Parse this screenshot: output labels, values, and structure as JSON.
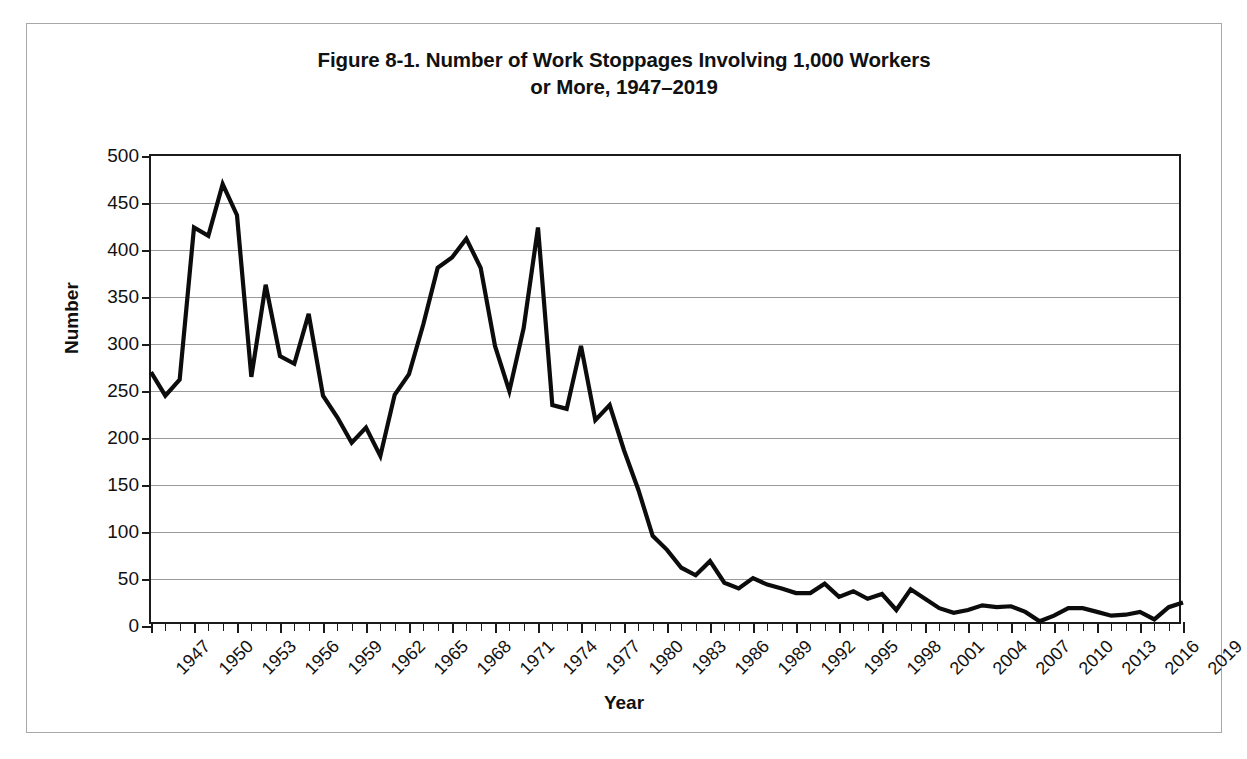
{
  "page": {
    "artifact_text": ""
  },
  "figure": {
    "title_line1": "Figure 8-1. Number of Work Stoppages Involving 1,000 Workers",
    "title_line2": "or More, 1947–2019"
  },
  "chart_data": {
    "type": "line",
    "title": "Figure 8-1. Number of Work Stoppages Involving 1,000 Workers or More, 1947–2019",
    "xlabel": "Year",
    "ylabel": "Number",
    "ylim": [
      0,
      500
    ],
    "ytick_step": 50,
    "yticks": [
      "0",
      "50",
      "100",
      "150",
      "200",
      "250",
      "300",
      "350",
      "400",
      "450",
      "500"
    ],
    "xlim": [
      1947,
      2019
    ],
    "xtick_step": 3,
    "xticks": [
      "1947",
      "1950",
      "1953",
      "1956",
      "1959",
      "1962",
      "1965",
      "1968",
      "1971",
      "1974",
      "1977",
      "1980",
      "1983",
      "1986",
      "1989",
      "1992",
      "1995",
      "1998",
      "2001",
      "2004",
      "2007",
      "2010",
      "2013",
      "2016",
      "2019"
    ],
    "grid": "horizontal",
    "legend": "none",
    "line_color": "#0c0c0c",
    "gridline_color": "#9a9a9a",
    "axis_color": "#1b1b1b",
    "x": [
      1947,
      1948,
      1949,
      1950,
      1951,
      1952,
      1953,
      1954,
      1955,
      1956,
      1957,
      1958,
      1959,
      1960,
      1961,
      1962,
      1963,
      1964,
      1965,
      1966,
      1967,
      1968,
      1969,
      1970,
      1971,
      1972,
      1973,
      1974,
      1975,
      1976,
      1977,
      1978,
      1979,
      1980,
      1981,
      1982,
      1983,
      1984,
      1985,
      1986,
      1987,
      1988,
      1989,
      1990,
      1991,
      1992,
      1993,
      1994,
      1995,
      1996,
      1997,
      1998,
      1999,
      2000,
      2001,
      2002,
      2003,
      2004,
      2005,
      2006,
      2007,
      2008,
      2009,
      2010,
      2011,
      2012,
      2013,
      2014,
      2015,
      2016,
      2017,
      2018,
      2019
    ],
    "values": [
      270,
      245,
      262,
      424,
      415,
      470,
      437,
      265,
      363,
      287,
      279,
      332,
      245,
      222,
      195,
      211,
      181,
      246,
      268,
      321,
      381,
      392,
      412,
      381,
      298,
      250,
      317,
      424,
      235,
      231,
      298,
      219,
      235,
      187,
      145,
      96,
      81,
      62,
      54,
      69,
      46,
      40,
      51,
      44,
      40,
      35,
      35,
      45,
      31,
      37,
      29,
      34,
      17,
      39,
      29,
      19,
      14,
      17,
      22,
      20,
      21,
      15,
      5,
      11,
      19,
      19,
      15,
      11,
      12,
      15,
      7,
      20,
      25
    ],
    "source_note": ""
  }
}
